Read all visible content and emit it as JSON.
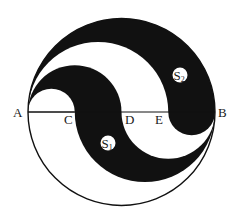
{
  "figure": {
    "type": "geometry-diagram",
    "colors": {
      "fill_dark": "#111111",
      "fill_light": "#ffffff",
      "stroke": "#111111"
    },
    "points": {
      "A": {
        "label": "A"
      },
      "C": {
        "label": "C"
      },
      "D": {
        "label": "D"
      },
      "E": {
        "label": "E"
      },
      "B": {
        "label": "B"
      }
    },
    "regions": {
      "S1": {
        "letter": "S",
        "subscript": "1"
      },
      "S2": {
        "letter": "S",
        "subscript": "2"
      }
    }
  }
}
